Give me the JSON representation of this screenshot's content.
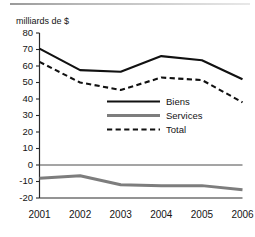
{
  "figure": {
    "axis_title": "milliards de $",
    "has_top_rule": true
  },
  "chart_data": {
    "type": "line",
    "title": "",
    "subtitle": "",
    "xlabel": "",
    "ylabel": "milliards de $",
    "categories": [
      "2001",
      "2002",
      "2003",
      "2004",
      "2005",
      "2006"
    ],
    "x": [
      2001,
      2002,
      2003,
      2004,
      2005,
      2006
    ],
    "ylim": [
      -20,
      80
    ],
    "xlim": [
      2001,
      2006
    ],
    "yticks": [
      80,
      70,
      60,
      50,
      40,
      30,
      20,
      10,
      0,
      -10,
      -20
    ],
    "ytick_labels": [
      "80",
      "70",
      "60",
      "50",
      "40",
      "30",
      "20",
      "10",
      "0",
      "-10",
      "-20"
    ],
    "xtick_labels": [
      "2001",
      "2002",
      "2003",
      "2004",
      "2005",
      "2006"
    ],
    "grid": false,
    "zero_line": true,
    "legend_position": "center-right-inside",
    "series": [
      {
        "name": "Biens",
        "values": [
          70.5,
          57.5,
          56.5,
          66.0,
          63.5,
          52.0
        ],
        "color": "#111111",
        "style": "solid",
        "width": 2.1
      },
      {
        "name": "Services",
        "values": [
          -8.0,
          -6.5,
          -12.0,
          -12.5,
          -12.5,
          -15.0
        ],
        "color": "#7d7d7d",
        "style": "solid",
        "width": 3.0
      },
      {
        "name": "Total",
        "values": [
          62.5,
          50.0,
          45.5,
          53.0,
          51.5,
          38.0
        ],
        "color": "#111111",
        "style": "dashed",
        "width": 2.1
      }
    ]
  },
  "legend": {
    "items": [
      {
        "label": "Biens"
      },
      {
        "label": "Services"
      },
      {
        "label": "Total"
      }
    ]
  }
}
